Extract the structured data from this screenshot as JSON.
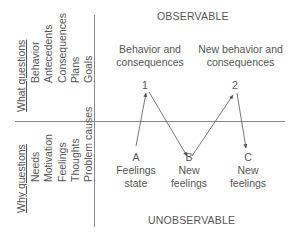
{
  "headers": {
    "top": "OBSERVABLE",
    "bottom": "UNOBSERVABLE"
  },
  "left_panel": {
    "what": {
      "title": "What questions",
      "items": [
        "Behavior",
        "Antecedents",
        "Consequences",
        "Plans",
        "Goals"
      ]
    },
    "why": {
      "title": "Why questions",
      "items": [
        "Needs",
        "Motivation",
        "Feelings",
        "Thoughts",
        "Problem causes"
      ]
    }
  },
  "observable_nodes": [
    {
      "id": "1",
      "caption_line1": "Behavior and",
      "caption_line2": "consequences"
    },
    {
      "id": "2",
      "caption_line1": "New behavior and",
      "caption_line2": "consequences"
    }
  ],
  "unobservable_nodes": [
    {
      "id": "A",
      "line1": "Feelings",
      "line2": "state"
    },
    {
      "id": "B",
      "line1": "New",
      "line2": "feelings"
    },
    {
      "id": "C",
      "line1": "New",
      "line2": "feelings"
    }
  ],
  "edges": [
    {
      "from": "A",
      "to": "1"
    },
    {
      "from": "1",
      "to": "B"
    },
    {
      "from": "B",
      "to": "2"
    },
    {
      "from": "2",
      "to": "C"
    }
  ],
  "colors": {
    "line": "#777777",
    "text": "#555555"
  }
}
